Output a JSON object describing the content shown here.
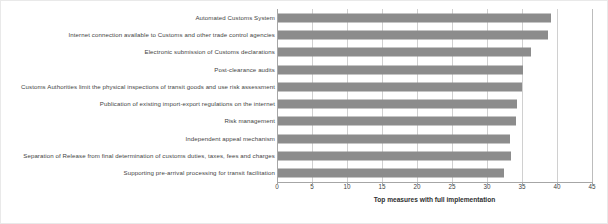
{
  "chart_data": {
    "type": "bar",
    "orientation": "horizontal",
    "title": "",
    "xlabel": "Top measures with full implementation",
    "ylabel": "",
    "xlim": [
      0,
      45
    ],
    "xticks": [
      0,
      5,
      10,
      15,
      20,
      25,
      30,
      35,
      40,
      45
    ],
    "grid": true,
    "legend": false,
    "bar_color": "#8c8c8c",
    "categories": [
      "Automated Customs System",
      "Internet connection available to Customs and other trade control agencies",
      "Electronic submission of Customs declarations",
      "Post-clearance audits",
      "Customs Authorities limit the physical inspections of transit goods and use risk assessment",
      "Publication of existing import-export regulations on the internet",
      "Risk management",
      "Independent appeal mechanism",
      "Separation of Release from final determination of customs duties, taxes, fees and charges",
      "Supporting pre-arrival processing for transit  facilitation"
    ],
    "values": [
      39,
      38.6,
      36.2,
      35,
      34.8,
      34.1,
      34,
      33.2,
      33.3,
      32.3
    ]
  }
}
